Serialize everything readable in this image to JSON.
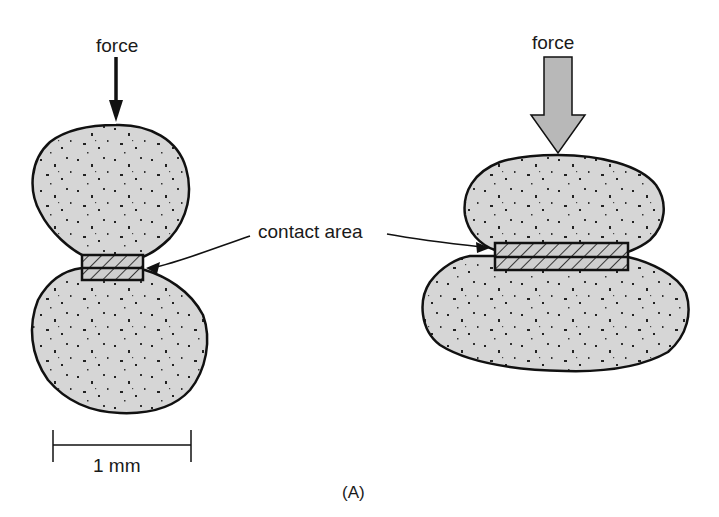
{
  "figure": {
    "panel_label": "(A)",
    "left_panel": {
      "force_label": "force",
      "force_arrow_style": "thin",
      "scale_bar_label": "1 mm"
    },
    "right_panel": {
      "force_label": "force",
      "force_arrow_style": "wide"
    },
    "callout": {
      "label": "contact area",
      "targets": [
        "left-contact-area",
        "right-contact-area"
      ]
    }
  },
  "colors": {
    "particle_fill": "#d6d6d6",
    "outline": "#111111",
    "arrow_fill": "#b8b8b8",
    "speckle": "#222222"
  }
}
